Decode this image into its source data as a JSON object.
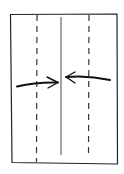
{
  "diagram": {
    "type": "origami-fold-instruction",
    "colors": {
      "background": "#ffffff",
      "ink": "#222222",
      "dash_ink": "#333333"
    },
    "elements": {
      "paper": {
        "label": "paper sheet",
        "shape": "rectangle"
      },
      "center_crease": {
        "label": "center crease",
        "style": "solid"
      },
      "left_fold_line": {
        "label": "left valley fold",
        "style": "dashed"
      },
      "right_fold_line": {
        "label": "right valley fold",
        "style": "dashed"
      },
      "left_arrow": {
        "label": "fold left edge to center",
        "direction": "right"
      },
      "right_arrow": {
        "label": "fold right edge to center",
        "direction": "left"
      }
    }
  }
}
